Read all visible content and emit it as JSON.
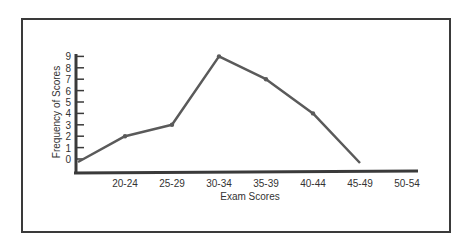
{
  "chart_data": {
    "type": "line",
    "title": "",
    "xlabel": "Exam Scores",
    "ylabel": "Frequency of Scores",
    "categories": [
      "15-19",
      "20-24",
      "25-29",
      "30-34",
      "35-39",
      "40-44",
      "45-49",
      "50-54"
    ],
    "x_tick_labels": [
      "20-24",
      "25-29",
      "30-34",
      "35-39",
      "40-44",
      "45-49",
      "50-54"
    ],
    "y_ticks": [
      0,
      1,
      2,
      3,
      4,
      5,
      6,
      7,
      8,
      9
    ],
    "values": [
      0,
      2,
      3,
      9,
      7,
      4,
      0,
      null
    ],
    "ylim": [
      0,
      9
    ],
    "grid": false,
    "legend": null
  },
  "colors": {
    "line": "#5a5a5a",
    "axis": "#3a3a3a",
    "frame": "#3a3a3a",
    "text": "#333333"
  }
}
